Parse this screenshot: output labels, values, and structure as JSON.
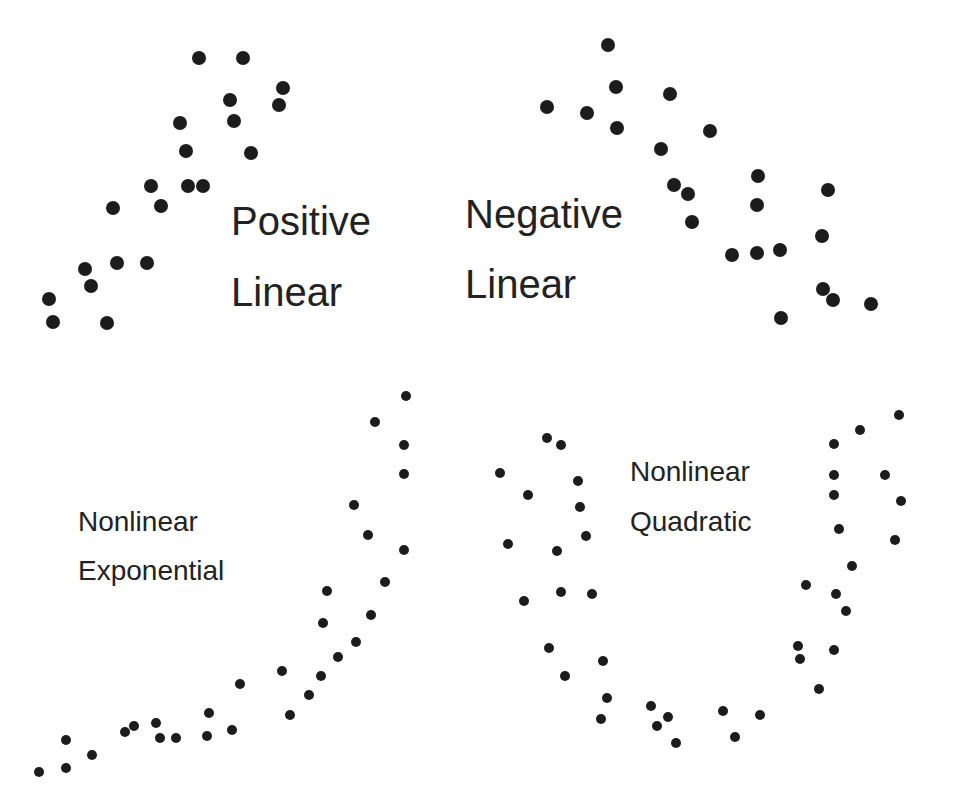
{
  "background": "#ffffff",
  "dot_color": "#1c1c1c",
  "text_color": "#222222",
  "panels": [
    {
      "id": "positive-linear",
      "label_lines": [
        "Positive",
        "Linear"
      ],
      "label_style": "big",
      "label_x": 231,
      "label_baselines": [
        237,
        308
      ],
      "dot_radius": 7,
      "points": [
        [
          199,
          58
        ],
        [
          243,
          58
        ],
        [
          283,
          88
        ],
        [
          279,
          105
        ],
        [
          230,
          100
        ],
        [
          234,
          121
        ],
        [
          180,
          123
        ],
        [
          186,
          151
        ],
        [
          251,
          153
        ],
        [
          151,
          186
        ],
        [
          188,
          186
        ],
        [
          203,
          186
        ],
        [
          161,
          206
        ],
        [
          113,
          208
        ],
        [
          117,
          263
        ],
        [
          147,
          263
        ],
        [
          85,
          269
        ],
        [
          91,
          286
        ],
        [
          49,
          299
        ],
        [
          53,
          322
        ],
        [
          107,
          323
        ]
      ]
    },
    {
      "id": "negative-linear",
      "label_lines": [
        "Negative",
        "Linear"
      ],
      "label_style": "big",
      "label_x": 465,
      "label_baselines": [
        230,
        300
      ],
      "dot_radius": 7,
      "points": [
        [
          608,
          45
        ],
        [
          616,
          87
        ],
        [
          670,
          94
        ],
        [
          547,
          107
        ],
        [
          587,
          113
        ],
        [
          617,
          128
        ],
        [
          710,
          131
        ],
        [
          661,
          149
        ],
        [
          758,
          176
        ],
        [
          828,
          190
        ],
        [
          674,
          185
        ],
        [
          688,
          194
        ],
        [
          757,
          205
        ],
        [
          692,
          222
        ],
        [
          822,
          236
        ],
        [
          732,
          255
        ],
        [
          757,
          253
        ],
        [
          780,
          250
        ],
        [
          823,
          289
        ],
        [
          833,
          300
        ],
        [
          871,
          304
        ],
        [
          781,
          318
        ]
      ]
    },
    {
      "id": "nonlinear-exponential",
      "label_lines": [
        "Nonlinear",
        "Exponential"
      ],
      "label_style": "small",
      "label_x": 78,
      "label_baselines": [
        533,
        582
      ],
      "dot_radius": 5,
      "points": [
        [
          406,
          396
        ],
        [
          375,
          422
        ],
        [
          404,
          445
        ],
        [
          404,
          474
        ],
        [
          354,
          505
        ],
        [
          368,
          535
        ],
        [
          404,
          550
        ],
        [
          385,
          582
        ],
        [
          327,
          591
        ],
        [
          323,
          623
        ],
        [
          371,
          615
        ],
        [
          356,
          642
        ],
        [
          338,
          657
        ],
        [
          282,
          671
        ],
        [
          321,
          676
        ],
        [
          240,
          684
        ],
        [
          309,
          695
        ],
        [
          209,
          713
        ],
        [
          290,
          715
        ],
        [
          134,
          726
        ],
        [
          125,
          732
        ],
        [
          156,
          723
        ],
        [
          232,
          730
        ],
        [
          66,
          740
        ],
        [
          160,
          738
        ],
        [
          176,
          738
        ],
        [
          207,
          736
        ],
        [
          92,
          755
        ],
        [
          66,
          768
        ],
        [
          39,
          772
        ]
      ]
    },
    {
      "id": "nonlinear-quadratic",
      "label_lines": [
        "Nonlinear",
        "Quadratic"
      ],
      "label_style": "small",
      "label_x": 630,
      "label_baselines": [
        483,
        533
      ],
      "dot_radius": 5,
      "points": [
        [
          547,
          438
        ],
        [
          561,
          445
        ],
        [
          500,
          473
        ],
        [
          578,
          481
        ],
        [
          528,
          495
        ],
        [
          580,
          507
        ],
        [
          586,
          536
        ],
        [
          508,
          544
        ],
        [
          557,
          551
        ],
        [
          561,
          592
        ],
        [
          592,
          594
        ],
        [
          524,
          601
        ],
        [
          549,
          648
        ],
        [
          603,
          661
        ],
        [
          565,
          676
        ],
        [
          607,
          698
        ],
        [
          601,
          719
        ],
        [
          651,
          706
        ],
        [
          668,
          717
        ],
        [
          657,
          726
        ],
        [
          676,
          743
        ],
        [
          723,
          711
        ],
        [
          760,
          715
        ],
        [
          735,
          737
        ],
        [
          899,
          415
        ],
        [
          860,
          430
        ],
        [
          834,
          444
        ],
        [
          834,
          475
        ],
        [
          885,
          475
        ],
        [
          834,
          495
        ],
        [
          901,
          501
        ],
        [
          839,
          529
        ],
        [
          895,
          540
        ],
        [
          852,
          566
        ],
        [
          806,
          585
        ],
        [
          836,
          594
        ],
        [
          846,
          611
        ],
        [
          798,
          646
        ],
        [
          800,
          659
        ],
        [
          834,
          650
        ],
        [
          819,
          689
        ]
      ]
    }
  ]
}
